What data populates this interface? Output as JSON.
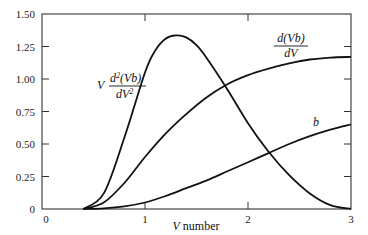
{
  "chart_data": {
    "type": "line",
    "title": "",
    "xlabel": "V number",
    "ylabel": "",
    "xlim": [
      0,
      3
    ],
    "ylim": [
      0,
      1.5
    ],
    "grid": false,
    "x_ticks": [
      "0",
      "1",
      "2",
      "3"
    ],
    "y_ticks": [
      "0",
      "0.25",
      "0.50",
      "0.75",
      "1.00",
      "1.25",
      "1.50"
    ],
    "series": [
      {
        "name": "b",
        "label_text": "b",
        "x": [
          0.4,
          0.6,
          0.8,
          1.0,
          1.2,
          1.4,
          1.6,
          1.8,
          2.0,
          2.2,
          2.4,
          2.6,
          2.8,
          3.0
        ],
        "values": [
          0.0,
          0.005,
          0.02,
          0.05,
          0.1,
          0.16,
          0.22,
          0.29,
          0.36,
          0.43,
          0.5,
          0.56,
          0.61,
          0.65
        ]
      },
      {
        "name": "d(Vb)/dV",
        "label_text": {
          "numerator": "d(Vb)",
          "denominator": "dV"
        },
        "x": [
          0.4,
          0.6,
          0.8,
          1.0,
          1.2,
          1.4,
          1.6,
          1.8,
          2.0,
          2.2,
          2.4,
          2.6,
          2.8,
          3.0
        ],
        "values": [
          0.0,
          0.05,
          0.2,
          0.4,
          0.58,
          0.73,
          0.86,
          0.96,
          1.03,
          1.08,
          1.12,
          1.15,
          1.165,
          1.17
        ]
      },
      {
        "name": "V d2(Vb)/dV2",
        "label_text": {
          "prefix": "V",
          "numerator": "d2(Vb)",
          "denominator": "dV2"
        },
        "x": [
          0.4,
          0.6,
          0.8,
          1.0,
          1.1,
          1.2,
          1.3,
          1.4,
          1.5,
          1.6,
          1.8,
          2.0,
          2.2,
          2.4,
          2.6,
          2.8,
          3.0
        ],
        "values": [
          0.0,
          0.12,
          0.55,
          1.05,
          1.22,
          1.31,
          1.335,
          1.32,
          1.26,
          1.16,
          0.92,
          0.66,
          0.44,
          0.26,
          0.12,
          0.03,
          0.0
        ]
      }
    ]
  },
  "labels": {
    "xlabel_v": "V",
    "xlabel_rest": " number",
    "b": "b",
    "dvb_num": "d(Vb)",
    "dvb_den": "dV",
    "d2_prefix": "V",
    "d2_num_d": "d",
    "d2_num_sup": "2",
    "d2_num_rest": "(Vb)",
    "d2_den_d": "dV",
    "d2_den_sup": "2"
  }
}
